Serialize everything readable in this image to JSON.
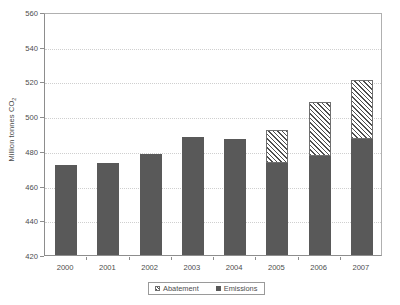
{
  "chart_data": {
    "type": "bar",
    "stacked": true,
    "title": "",
    "xlabel": "",
    "ylabel": "Million tonnes CO2",
    "ylabel_text": "Million tonnes CO",
    "ylabel_sub": "2",
    "categories": [
      "2000",
      "2001",
      "2002",
      "2003",
      "2004",
      "2005",
      "2006",
      "2007"
    ],
    "ylim": [
      420,
      560
    ],
    "ytick_labels": [
      "420",
      "440",
      "460",
      "480",
      "500",
      "520",
      "540",
      "560"
    ],
    "ytick_values": [
      420,
      440,
      460,
      480,
      500,
      520,
      540,
      560
    ],
    "grid": true,
    "grid_axis": "y",
    "legend_position": "bottom-center",
    "series": [
      {
        "name": "Emissions",
        "style": "solid",
        "color": "#595959",
        "values": [
          472,
          473,
          478,
          488,
          487,
          473,
          477,
          487
        ]
      },
      {
        "name": "Abatement",
        "style": "hatched",
        "color": "#4f4f4f",
        "values": [
          0,
          0,
          0,
          0,
          0,
          19,
          31,
          34
        ]
      }
    ],
    "stack_totals": [
      472,
      473,
      478,
      488,
      487,
      492,
      508,
      521
    ]
  },
  "legend": {
    "items": [
      {
        "label": "Abatement",
        "swatch": "hatch-swatch"
      },
      {
        "label": "Emissions",
        "swatch": "solid-swatch"
      }
    ]
  },
  "colors": {
    "emissions": "#595959",
    "abatement": "#4f4f4f",
    "grid": "#cfcfcf",
    "axis": "#8d8d8d",
    "text": "#4d4d4d",
    "background": "#ffffff"
  }
}
